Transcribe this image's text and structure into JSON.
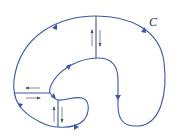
{
  "diagram": {
    "type": "region-with-cuts",
    "curve_label": "C",
    "colors": {
      "curve": "#3a56a8",
      "small_arrows": "#555555",
      "label": "#1a2a6a"
    }
  }
}
